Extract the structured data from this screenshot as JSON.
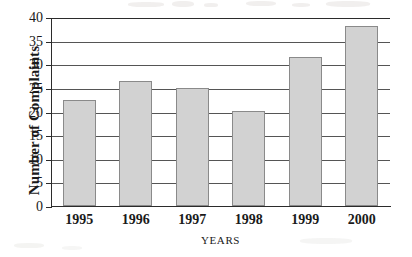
{
  "chart_data": {
    "type": "bar",
    "title": "",
    "xlabel": "YEARS",
    "ylabel": "Number of Complaints",
    "categories": [
      "1995",
      "1996",
      "1997",
      "1998",
      "1999",
      "2000"
    ],
    "values": [
      22.5,
      26.5,
      25,
      20.2,
      31.5,
      38
    ],
    "ylim": [
      0,
      40
    ],
    "ytick_values": [
      0,
      5,
      10,
      15,
      20,
      25,
      30,
      35,
      40
    ],
    "ytick_labels": [
      "0",
      "5",
      "10",
      "15",
      "20",
      "25",
      "30",
      "35",
      "40"
    ],
    "grid": "horizontal",
    "legend": "none",
    "bar_fill_color": "#d2d2d2",
    "bar_edge_color": "#8a8a8a",
    "axis_color": "#2b2b2b",
    "gridline_color": "#555555",
    "background_color": "#ffffff"
  }
}
